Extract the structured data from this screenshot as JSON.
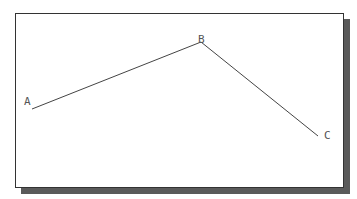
{
  "diagram": {
    "type": "polyline",
    "colors": {
      "line": "#444444",
      "label": "#555555",
      "frame": "#333333",
      "shadow": "#5a5a5a"
    },
    "points": [
      {
        "label": "A",
        "x": 32,
        "y": 109,
        "label_x": 24,
        "label_y": 105
      },
      {
        "label": "B",
        "x": 201,
        "y": 42,
        "label_x": 198,
        "label_y": 43
      },
      {
        "label": "C",
        "x": 318,
        "y": 136,
        "label_x": 324,
        "label_y": 139
      }
    ]
  }
}
